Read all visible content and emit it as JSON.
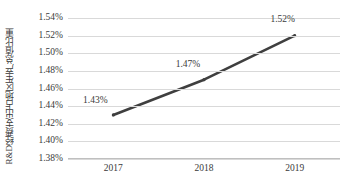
{
  "chart_data": {
    "type": "line",
    "title": "",
    "xlabel": "",
    "ylabel": "R&D经费支出占地区生产总值比重",
    "categories": [
      "2017",
      "2018",
      "2019"
    ],
    "values": [
      1.43,
      1.47,
      1.52
    ],
    "value_labels": [
      "1.43%",
      "1.47%",
      "1.52%"
    ],
    "series": [
      {
        "name": "R&D经费支出占地区生产总值比重",
        "values": [
          1.43,
          1.47,
          1.52
        ],
        "color": "#3f3f3f"
      }
    ],
    "ylim": [
      1.38,
      1.54
    ],
    "ytick_values": [
      1.54,
      1.52,
      1.5,
      1.48,
      1.46,
      1.44,
      1.42,
      1.4,
      1.38
    ],
    "ytick_labels": [
      "1.54%",
      "1.52%",
      "1.50%",
      "1.48%",
      "1.46%",
      "1.44%",
      "1.42%",
      "1.40%",
      "1.38%"
    ],
    "grid": true,
    "grid_color": "#d9d9d9",
    "legend": false,
    "legend_position": "none",
    "axis_color": "#bfbfbf",
    "text_color": "#3a3a3a",
    "background": "#ffffff"
  }
}
